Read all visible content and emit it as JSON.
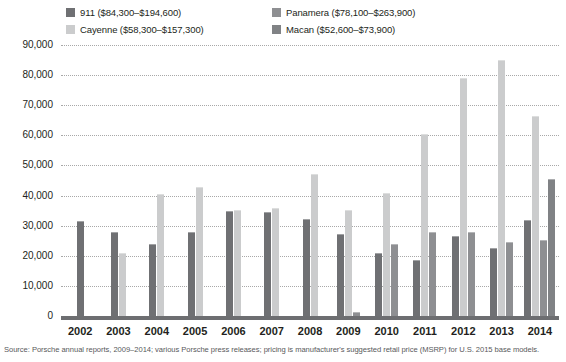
{
  "chart_data": {
    "type": "bar",
    "title": "",
    "subtitle": "",
    "xlabel": "",
    "ylabel": "",
    "ylim": [
      0,
      90000
    ],
    "ytick_step": 10000,
    "ytick_labels": [
      "90,000",
      "80,000",
      "70,000",
      "60,000",
      "50,000",
      "40,000",
      "30,000",
      "20,000",
      "10,000",
      "0"
    ],
    "grid": true,
    "legend_position": "top",
    "categories": [
      "2002",
      "2003",
      "2004",
      "2005",
      "2006",
      "2007",
      "2008",
      "2009",
      "2010",
      "2011",
      "2012",
      "2013",
      "2014"
    ],
    "series": [
      {
        "name": "911",
        "legend_label": "911 ($84,300–$194,600)",
        "price_low": 84300,
        "price_high": 194600,
        "color": "#6f7073",
        "values": [
          31500,
          28000,
          24000,
          27800,
          35000,
          34700,
          32300,
          27300,
          20800,
          18600,
          26600,
          22500,
          31800
        ]
      },
      {
        "name": "Cayenne",
        "legend_label": "Cayenne ($58,300–$157,300)",
        "price_low": 58300,
        "price_high": 157300,
        "color": "#cbcccd",
        "values": [
          null,
          20800,
          40500,
          42700,
          35200,
          36000,
          47000,
          35200,
          41000,
          60500,
          78900,
          84900,
          66400
        ]
      },
      {
        "name": "Panamera",
        "legend_label": "Panamera ($78,100–$263,900)",
        "price_low": 78100,
        "price_high": 263900,
        "color": "#8e8f92",
        "values": [
          null,
          null,
          null,
          null,
          null,
          null,
          null,
          1300,
          24000,
          28000,
          28000,
          24500,
          25300
        ]
      },
      {
        "name": "Macan",
        "legend_label": "Macan ($52,600–$73,900)",
        "price_low": 52600,
        "price_high": 73900,
        "color": "#808285",
        "values": [
          null,
          null,
          null,
          null,
          null,
          null,
          null,
          null,
          null,
          null,
          null,
          null,
          45500
        ]
      }
    ]
  },
  "source": {
    "note": "Source: Porsche annual reports, 2009–2014; various Porsche press releases; pricing is manufacturer's suggested retail price (MSRP) for U.S. 2015 base models."
  },
  "colors": {
    "axis": "#6d6e71",
    "grid": "#a8a8a8",
    "text": "#231f20",
    "source_text": "#58595b",
    "background": "#ffffff"
  }
}
